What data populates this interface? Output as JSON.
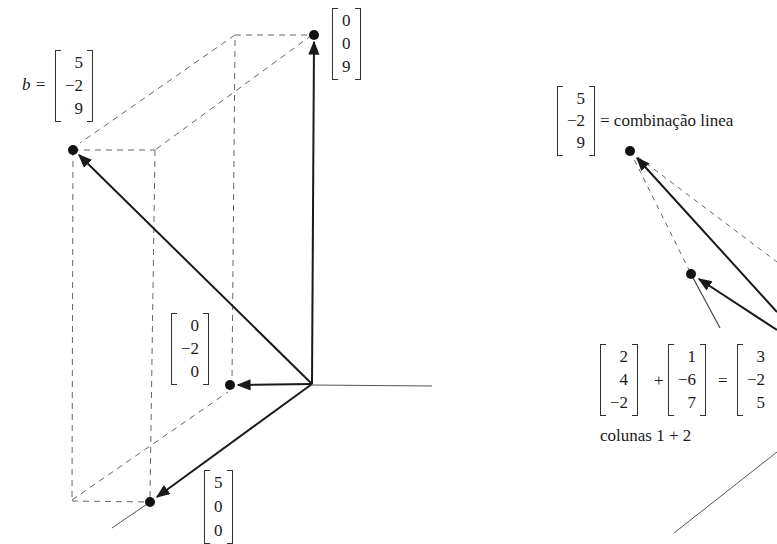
{
  "left_diagram": {
    "b_label": "b =",
    "vectors": {
      "b": [
        "5",
        "−2",
        "9"
      ],
      "z": [
        "0",
        "0",
        "9"
      ],
      "y": [
        "0",
        "−2",
        "0"
      ],
      "x": [
        "5",
        "0",
        "0"
      ]
    }
  },
  "right_diagram": {
    "b_vector": [
      "5",
      "−2",
      "9"
    ],
    "equals_text": "= combinação linea",
    "sum": {
      "col1": [
        "2",
        "4",
        "−2"
      ],
      "plus": "+",
      "col2": [
        "1",
        "−6",
        "7"
      ],
      "equals": "=",
      "result": [
        "3",
        "−2",
        "5"
      ]
    },
    "caption": "colunas 1 + 2"
  },
  "colors": {
    "ink": "#1a1a1a",
    "dashed": "#666666",
    "axis": "#555555"
  }
}
